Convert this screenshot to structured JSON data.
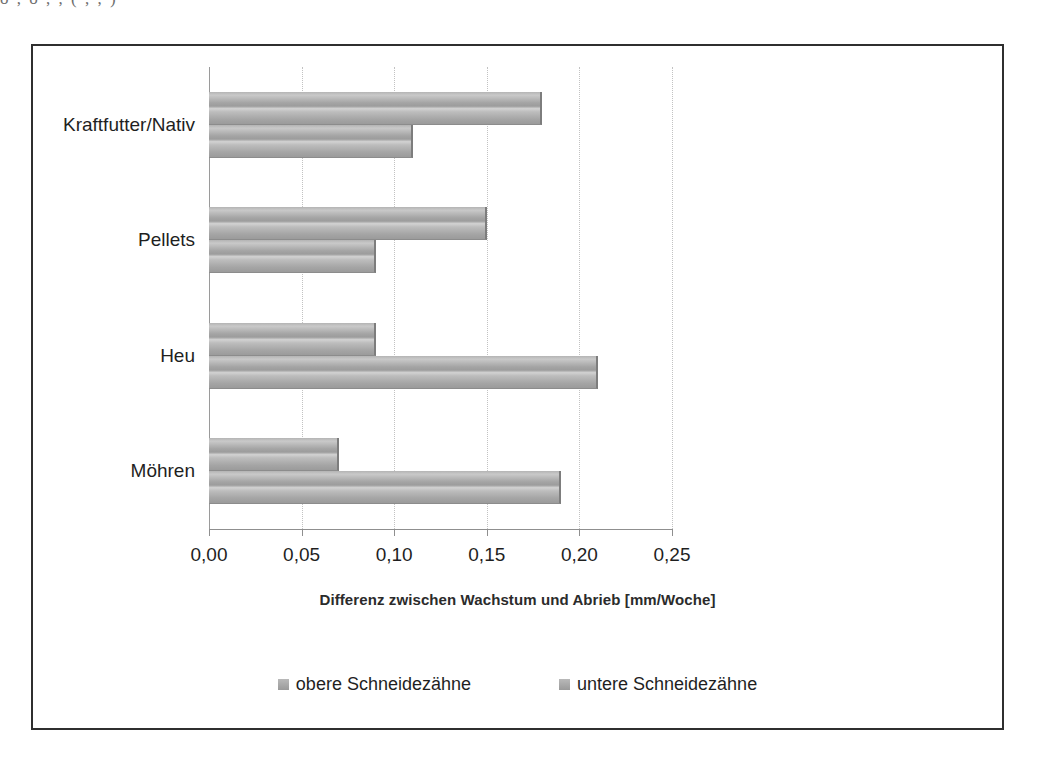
{
  "page_residue": {
    "text": "o    ,   o         ,   ,    (   ,   ,   )"
  },
  "chart_data": {
    "type": "bar",
    "orientation": "horizontal",
    "grouped": true,
    "title": "",
    "subtitle": "",
    "xlabel": "Differenz zwischen Wachstum und Abrieb [mm/Woche]",
    "ylabel": "",
    "categories": [
      "Kraftfutter/Nativ",
      "Pellets",
      "Heu",
      "Möhren"
    ],
    "series": [
      {
        "name": "obere Schneidezähne",
        "values": [
          0.18,
          0.15,
          0.09,
          0.07
        ],
        "color": "#a8a8a8"
      },
      {
        "name": "untere Schneidezähne",
        "values": [
          0.11,
          0.09,
          0.21,
          0.19
        ],
        "color": "#a8a8a8"
      }
    ],
    "xlim": [
      0,
      0.25
    ],
    "xticks": [
      0,
      0.05,
      0.1,
      0.15,
      0.2,
      0.25
    ],
    "xtick_labels": [
      "0,00",
      "0,05",
      "0,10",
      "0,15",
      "0,20",
      "0,25"
    ],
    "grid": "vertical-dotted",
    "legend_position": "bottom",
    "frame": true,
    "bar_color": "#a8a8a8",
    "frame_color": "#2f2f2f",
    "gridline_color": "#c2c2c2"
  }
}
